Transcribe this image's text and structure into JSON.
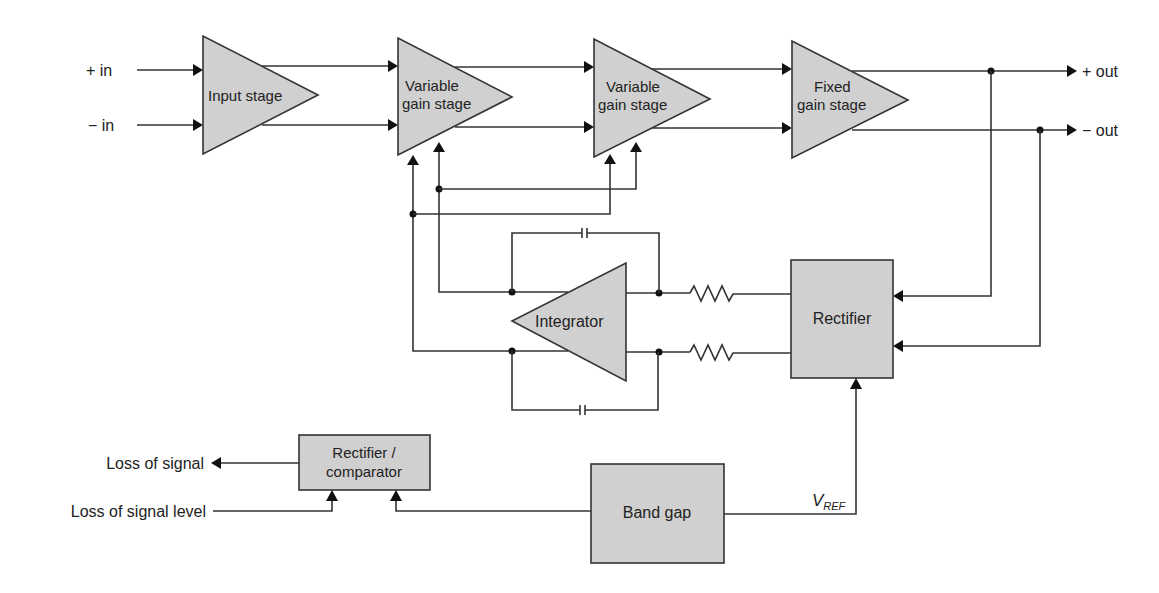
{
  "diagram": {
    "type": "block-diagram",
    "colors": {
      "block_fill": "#d0d0d0",
      "line": "#333333",
      "background": "#ffffff"
    },
    "inputs": {
      "plus_in": "+ in",
      "minus_in": "− in"
    },
    "outputs": {
      "plus_out": "+ out",
      "minus_out": "− out"
    },
    "blocks": {
      "input_stage": {
        "label": "Input stage"
      },
      "vga1": {
        "line1": "Variable",
        "line2": "gain stage"
      },
      "vga2": {
        "line1": "Variable",
        "line2": "gain stage"
      },
      "fixed": {
        "line1": "Fixed",
        "line2": "gain stage"
      },
      "integrator": {
        "label": "Integrator"
      },
      "rectifier": {
        "label": "Rectifier"
      },
      "rect_comp": {
        "line1": "Rectifier /",
        "line2": "comparator"
      },
      "band_gap": {
        "label": "Band gap"
      }
    },
    "signals": {
      "loss_of_signal": "Loss of signal",
      "loss_of_signal_level": "Loss of signal level",
      "vref_main": "V",
      "vref_sub": "REF"
    }
  }
}
